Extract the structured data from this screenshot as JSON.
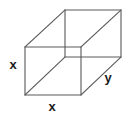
{
  "figure": {
    "name": "rectangular-prism",
    "stroke_color": "#5a5a5a",
    "label_color": "#1c1c1c",
    "background_color": "#ffffff",
    "width": 129,
    "height": 118
  },
  "labels": {
    "height_edge": "x",
    "front_bottom_edge": "x",
    "depth_edge": "y"
  },
  "label_positions": {
    "height_edge": {
      "x": 13,
      "y": 66
    },
    "front_bottom_edge": {
      "x": 52,
      "y": 108
    },
    "depth_edge": {
      "x": 108,
      "y": 79
    }
  },
  "vertices": {
    "front_top_left": {
      "x": 25,
      "y": 47
    },
    "front_top_right": {
      "x": 81,
      "y": 47
    },
    "front_bottom_right": {
      "x": 81,
      "y": 95
    },
    "front_bottom_left": {
      "x": 25,
      "y": 95
    },
    "back_top_left": {
      "x": 65,
      "y": 10
    },
    "back_top_right": {
      "x": 121,
      "y": 10
    },
    "back_bottom_right": {
      "x": 121,
      "y": 57
    },
    "back_bottom_left": {
      "x": 65,
      "y": 57
    }
  },
  "edges": {
    "front_face": "M25,47 L81,47 L81,95 L25,95 Z",
    "back_face": "M65,10 L121,10 L121,57 L65,57 Z",
    "connector_top_left": "M25,47 L65,10",
    "connector_top_right": "M81,47 L121,10",
    "connector_bottom_right": "M81,95 L121,57",
    "connector_bottom_left": "M25,95 L65,57"
  }
}
